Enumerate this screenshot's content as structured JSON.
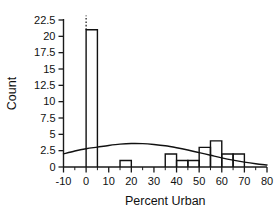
{
  "chart_data": {
    "type": "bar",
    "title": "",
    "subtitle": "",
    "xlabel": "Percent Urban",
    "ylabel": "Count",
    "xlim": [
      -10,
      80
    ],
    "ylim": [
      0,
      22.5
    ],
    "grid": false,
    "legend": null,
    "bin_width": 5,
    "x_ticks": [
      -10,
      0,
      10,
      20,
      30,
      40,
      50,
      60,
      70,
      80
    ],
    "x_tick_labels": [
      "-10",
      "0",
      "10",
      "20",
      "30",
      "40",
      "50",
      "60",
      "70",
      "80"
    ],
    "x_minor_tick_step": 5,
    "y_ticks": [
      0,
      2.5,
      5,
      7.5,
      10,
      12.5,
      15,
      17.5,
      20,
      22.5
    ],
    "y_tick_labels": [
      "0",
      "2.5",
      "5",
      "7.5",
      "10",
      "12.5",
      "15",
      "17.5",
      "20",
      "22.5"
    ],
    "bins": [
      {
        "x0": 0,
        "x1": 5,
        "count": 21
      },
      {
        "x0": 15,
        "x1": 20,
        "count": 1
      },
      {
        "x0": 35,
        "x1": 40,
        "count": 2
      },
      {
        "x0": 40,
        "x1": 45,
        "count": 1
      },
      {
        "x0": 45,
        "x1": 50,
        "count": 1
      },
      {
        "x0": 50,
        "x1": 55,
        "count": 3
      },
      {
        "x0": 55,
        "x1": 60,
        "count": 4
      },
      {
        "x0": 60,
        "x1": 65,
        "count": 2
      },
      {
        "x0": 65,
        "x1": 70,
        "count": 2
      }
    ],
    "categories": [
      "0-5",
      "15-20",
      "35-40",
      "40-45",
      "45-50",
      "50-55",
      "55-60",
      "60-65",
      "65-70"
    ],
    "values": [
      21,
      1,
      2,
      1,
      1,
      3,
      4,
      2,
      2
    ],
    "overlay_curve": {
      "name": "normal-density-overlay",
      "points": [
        {
          "x": -10,
          "y": 2.0
        },
        {
          "x": -5,
          "y": 2.45
        },
        {
          "x": 0,
          "y": 2.8
        },
        {
          "x": 5,
          "y": 3.05
        },
        {
          "x": 10,
          "y": 3.3
        },
        {
          "x": 15,
          "y": 3.5
        },
        {
          "x": 20,
          "y": 3.6
        },
        {
          "x": 25,
          "y": 3.58
        },
        {
          "x": 30,
          "y": 3.45
        },
        {
          "x": 35,
          "y": 3.25
        },
        {
          "x": 40,
          "y": 2.95
        },
        {
          "x": 45,
          "y": 2.6
        },
        {
          "x": 50,
          "y": 2.2
        },
        {
          "x": 55,
          "y": 1.8
        },
        {
          "x": 60,
          "y": 1.4
        },
        {
          "x": 65,
          "y": 1.05
        },
        {
          "x": 70,
          "y": 0.75
        },
        {
          "x": 75,
          "y": 0.5
        },
        {
          "x": 80,
          "y": 0.3
        }
      ]
    },
    "reference_line": {
      "name": "top-dotted-marker",
      "x": 0,
      "y_from": 21,
      "y_to": 23.2
    },
    "colors": {
      "axis": "#1a1a1a",
      "bar_stroke": "#111111",
      "bar_fill": "none",
      "curve": "#111111",
      "background": "#ffffff"
    }
  }
}
